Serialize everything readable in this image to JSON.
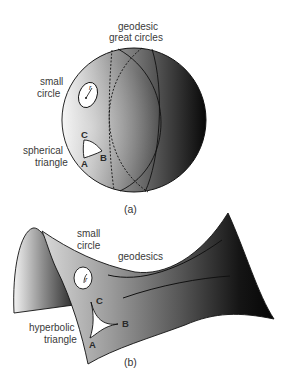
{
  "figure_a": {
    "caption": "(a)",
    "labels": {
      "geodesic_line1": "geodesic",
      "geodesic_line2": "great circles",
      "small_circle_line1": "small",
      "small_circle_line2": "circle",
      "triangle_line1": "spherical",
      "triangle_line2": "triangle",
      "radius": "r",
      "vertex_a": "A",
      "vertex_b": "B",
      "vertex_c": "C"
    }
  },
  "figure_b": {
    "caption": "(b)",
    "labels": {
      "small_circle_line1": "small",
      "small_circle_line2": "circle",
      "geodesics": "geodesics",
      "triangle_line1": "hyperbolic",
      "triangle_line2": "triangle",
      "radius": "r",
      "vertex_a": "A",
      "vertex_b": "B",
      "vertex_c": "C"
    }
  },
  "colors": {
    "background": "#ffffff",
    "surface_light": "#f2f2f2",
    "surface_dark": "#0a0a0a",
    "line": "#111111"
  }
}
